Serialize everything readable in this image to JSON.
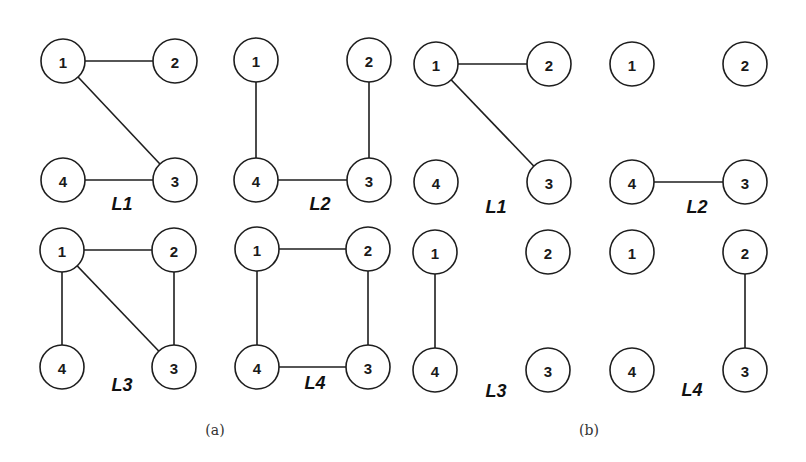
{
  "figure": {
    "node_radius": 22,
    "stroke_color": "#1e1e1e",
    "background": "#ffffff",
    "captions": [
      {
        "id": "a",
        "text": "(a)",
        "x": 215,
        "y": 430
      },
      {
        "id": "b",
        "text": "(b)",
        "x": 589,
        "y": 430
      }
    ],
    "panels": [
      {
        "group": "a",
        "label": "L1",
        "label_pos": {
          "x": 122,
          "y": 204
        },
        "nodes": [
          {
            "id": "1",
            "x": 63,
            "y": 61
          },
          {
            "id": "2",
            "x": 175,
            "y": 61
          },
          {
            "id": "3",
            "x": 175,
            "y": 180
          },
          {
            "id": "4",
            "x": 63,
            "y": 180
          }
        ],
        "edges": [
          [
            "1",
            "2"
          ],
          [
            "1",
            "3"
          ],
          [
            "4",
            "3"
          ]
        ]
      },
      {
        "group": "a",
        "label": "L2",
        "label_pos": {
          "x": 320,
          "y": 204
        },
        "nodes": [
          {
            "id": "1",
            "x": 256,
            "y": 60
          },
          {
            "id": "2",
            "x": 369,
            "y": 60
          },
          {
            "id": "3",
            "x": 369,
            "y": 180
          },
          {
            "id": "4",
            "x": 256,
            "y": 180
          }
        ],
        "edges": [
          [
            "1",
            "4"
          ],
          [
            "2",
            "3"
          ],
          [
            "4",
            "3"
          ]
        ]
      },
      {
        "group": "b",
        "label": "L1",
        "label_pos": {
          "x": 496,
          "y": 207
        },
        "nodes": [
          {
            "id": "1",
            "x": 436,
            "y": 64
          },
          {
            "id": "2",
            "x": 549,
            "y": 64
          },
          {
            "id": "3",
            "x": 549,
            "y": 182
          },
          {
            "id": "4",
            "x": 436,
            "y": 182
          }
        ],
        "edges": [
          [
            "1",
            "2"
          ],
          [
            "1",
            "3"
          ]
        ]
      },
      {
        "group": "b",
        "label": "L2",
        "label_pos": {
          "x": 697,
          "y": 207
        },
        "nodes": [
          {
            "id": "1",
            "x": 632,
            "y": 64
          },
          {
            "id": "2",
            "x": 745,
            "y": 64
          },
          {
            "id": "3",
            "x": 745,
            "y": 182
          },
          {
            "id": "4",
            "x": 632,
            "y": 182
          }
        ],
        "edges": [
          [
            "4",
            "3"
          ]
        ]
      },
      {
        "group": "a",
        "label": "L3",
        "label_pos": {
          "x": 122,
          "y": 385
        },
        "nodes": [
          {
            "id": "1",
            "x": 62,
            "y": 250
          },
          {
            "id": "2",
            "x": 174,
            "y": 250
          },
          {
            "id": "3",
            "x": 174,
            "y": 367
          },
          {
            "id": "4",
            "x": 62,
            "y": 367
          }
        ],
        "edges": [
          [
            "1",
            "2"
          ],
          [
            "1",
            "4"
          ],
          [
            "1",
            "3"
          ],
          [
            "2",
            "3"
          ]
        ]
      },
      {
        "group": "a",
        "label": "L4",
        "label_pos": {
          "x": 315,
          "y": 383
        },
        "nodes": [
          {
            "id": "1",
            "x": 257,
            "y": 249
          },
          {
            "id": "2",
            "x": 368,
            "y": 249
          },
          {
            "id": "3",
            "x": 368,
            "y": 367
          },
          {
            "id": "4",
            "x": 257,
            "y": 367
          }
        ],
        "edges": [
          [
            "1",
            "2"
          ],
          [
            "1",
            "4"
          ],
          [
            "2",
            "3"
          ],
          [
            "4",
            "3"
          ]
        ]
      },
      {
        "group": "b",
        "label": "L3",
        "label_pos": {
          "x": 496,
          "y": 391
        },
        "nodes": [
          {
            "id": "1",
            "x": 435,
            "y": 252
          },
          {
            "id": "2",
            "x": 548,
            "y": 252
          },
          {
            "id": "3",
            "x": 548,
            "y": 370
          },
          {
            "id": "4",
            "x": 435,
            "y": 370
          }
        ],
        "edges": [
          [
            "1",
            "4"
          ]
        ]
      },
      {
        "group": "b",
        "label": "L4",
        "label_pos": {
          "x": 692,
          "y": 390
        },
        "nodes": [
          {
            "id": "1",
            "x": 632,
            "y": 252
          },
          {
            "id": "2",
            "x": 745,
            "y": 252
          },
          {
            "id": "3",
            "x": 745,
            "y": 370
          },
          {
            "id": "4",
            "x": 632,
            "y": 370
          }
        ],
        "edges": [
          [
            "2",
            "3"
          ]
        ]
      }
    ]
  }
}
